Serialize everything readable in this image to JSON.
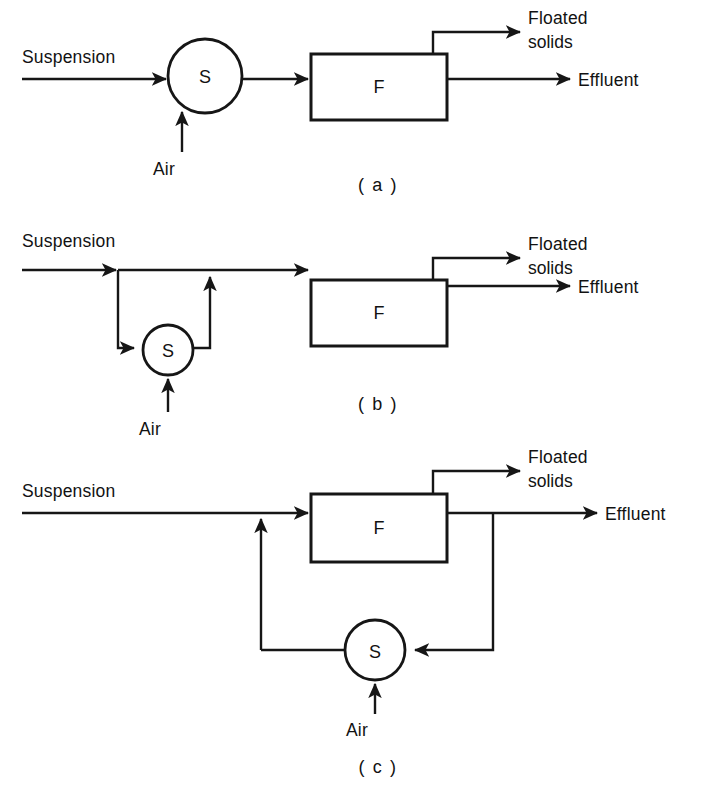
{
  "figure": {
    "type": "process-flow-diagram",
    "background_color": "#ffffff",
    "line_color": "#161616",
    "panels": [
      {
        "id": "a",
        "caption": "( a )",
        "units": [
          {
            "kind": "circle",
            "label": "S",
            "name": "saturator"
          },
          {
            "kind": "box",
            "label": "F",
            "name": "flotation-unit"
          }
        ],
        "labels": {
          "inlet": "Suspension",
          "air": "Air",
          "top_outlet_line1": "Floated",
          "top_outlet_line2": "solids",
          "bottom_outlet": "Effluent"
        }
      },
      {
        "id": "b",
        "caption": "( b )",
        "units": [
          {
            "kind": "circle",
            "label": "S",
            "name": "saturator"
          },
          {
            "kind": "box",
            "label": "F",
            "name": "flotation-unit"
          }
        ],
        "labels": {
          "inlet": "Suspension",
          "air": "Air",
          "top_outlet_line1": "Floated",
          "top_outlet_line2": "solids",
          "bottom_outlet": "Effluent"
        }
      },
      {
        "id": "c",
        "caption": "( c )",
        "units": [
          {
            "kind": "circle",
            "label": "S",
            "name": "saturator"
          },
          {
            "kind": "box",
            "label": "F",
            "name": "flotation-unit"
          }
        ],
        "labels": {
          "inlet": "Suspension",
          "air": "Air",
          "top_outlet_line1": "Floated",
          "top_outlet_line2": "solids",
          "bottom_outlet": "Effluent"
        }
      }
    ]
  }
}
